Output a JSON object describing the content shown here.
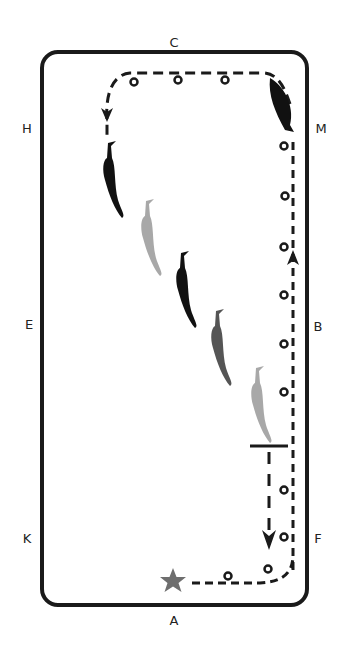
{
  "diagram": {
    "colors": {
      "border": "#1a1a1a",
      "path": "#1a1a1a",
      "horse_black": "#111111",
      "horse_dark_gray": "#555555",
      "horse_light_gray": "#a8a8a8",
      "star": "#6e6e6e",
      "background": "#ffffff"
    },
    "markers": [
      {
        "letter": "C",
        "x": 174,
        "y": 42
      },
      {
        "letter": "H",
        "x": 27,
        "y": 128
      },
      {
        "letter": "M",
        "x": 321,
        "y": 128
      },
      {
        "letter": "E",
        "x": 29,
        "y": 324
      },
      {
        "letter": "B",
        "x": 318,
        "y": 326
      },
      {
        "letter": "K",
        "x": 27,
        "y": 538
      },
      {
        "letter": "F",
        "x": 318,
        "y": 538
      },
      {
        "letter": "A",
        "x": 174,
        "y": 620
      }
    ],
    "start_symbol": "star-icon",
    "legend_symbols": [
      "footprint-circle",
      "dashed-track",
      "direction-arrow",
      "halt-line"
    ]
  }
}
